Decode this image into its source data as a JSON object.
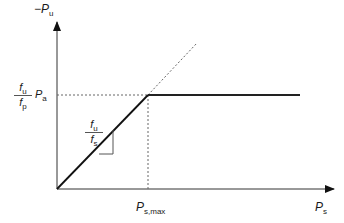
{
  "diagram": {
    "type": "elastic-perfectly-plastic load relationship",
    "y_axis": {
      "label_main": "−P",
      "label_sub": "u"
    },
    "x_axis": {
      "label_main": "P",
      "label_sub": "s"
    },
    "plateau_label": {
      "numerator_main": "f",
      "numerator_sub": "u",
      "denominator_main": "f",
      "denominator_sub": "p",
      "suffix_main": "P",
      "suffix_sub": "a"
    },
    "slope_label": {
      "numerator_main": "f",
      "numerator_sub": "u",
      "denominator_main": "f",
      "denominator_sub": "s"
    },
    "knee_x_label": {
      "main": "P",
      "sub": "s,max"
    },
    "colors": {
      "line": "#1a1a1a",
      "dashed": "#666666",
      "axis": "#333333"
    }
  }
}
